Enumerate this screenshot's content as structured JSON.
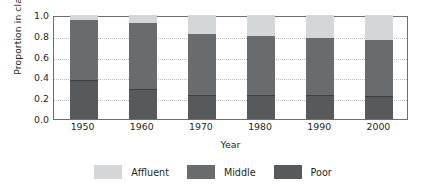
{
  "chart_data": {
    "type": "bar",
    "subtype": "stacked-bar-proportional",
    "title": "",
    "xlabel": "Year",
    "ylabel": "Proportion in class",
    "categories": [
      "1950",
      "1960",
      "1970",
      "1980",
      "1990",
      "2000"
    ],
    "ylim": [
      0.0,
      1.0
    ],
    "yticks": [
      "1.0",
      "0.8",
      "0.6",
      "0.4",
      "0.2",
      "0.0"
    ],
    "ytick_values": [
      1.0,
      0.8,
      0.6,
      0.4,
      0.2,
      0.0
    ],
    "grid": "horizontal-dotted",
    "legend_position": "bottom-center",
    "stack_order_bottom_to_top": [
      "Poor",
      "Middle",
      "Affluent"
    ],
    "series": [
      {
        "name": "Poor",
        "color": "#58595b",
        "values": [
          0.37,
          0.28,
          0.22,
          0.22,
          0.22,
          0.21
        ]
      },
      {
        "name": "Middle",
        "color": "#6a6b6d",
        "values": [
          0.58,
          0.64,
          0.6,
          0.58,
          0.56,
          0.55
        ]
      },
      {
        "name": "Affluent",
        "color": "#d5d6d8",
        "values": [
          0.05,
          0.08,
          0.18,
          0.2,
          0.22,
          0.24
        ]
      }
    ],
    "cumulative_tops": {
      "poor": [
        0.37,
        0.28,
        0.22,
        0.22,
        0.22,
        0.21
      ],
      "middle": [
        0.95,
        0.92,
        0.82,
        0.8,
        0.78,
        0.76
      ],
      "total": [
        1.0,
        1.0,
        1.0,
        1.0,
        1.0,
        1.0
      ]
    }
  },
  "legend": {
    "items": [
      {
        "label": "Affluent",
        "color": "#d5d6d8"
      },
      {
        "label": "Middle",
        "color": "#6a6b6d"
      },
      {
        "label": "Poor",
        "color": "#58595b"
      }
    ]
  },
  "colors": {
    "axis": "#6d6e71",
    "grid": "#b9bbbd",
    "text": "#231f20",
    "background": "#ffffff"
  }
}
